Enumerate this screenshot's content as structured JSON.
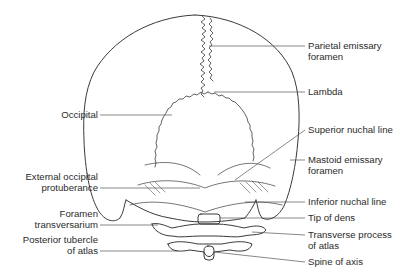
{
  "diagram": {
    "labels_right": [
      {
        "id": "parietal-emissary-foramen",
        "text": "Parietal emissary",
        "text2": "foramen"
      },
      {
        "id": "lambda",
        "text": "Lambda"
      },
      {
        "id": "superior-nuchal-line",
        "text": "Superior nuchal line"
      },
      {
        "id": "mastoid-emissary-foramen",
        "text": "Mastoid emissary",
        "text2": "foramen"
      },
      {
        "id": "inferior-nuchal-line",
        "text": "Inferior nuchal line"
      },
      {
        "id": "tip-of-dens",
        "text": "Tip of dens"
      },
      {
        "id": "transverse-process-of-atlas",
        "text": "Transverse process",
        "text2": "of atlas"
      },
      {
        "id": "spine-of-axis",
        "text": "Spine of axis"
      }
    ],
    "labels_left": [
      {
        "id": "occipital",
        "text": "Occipital"
      },
      {
        "id": "external-occipital-protuberance",
        "text": "External occipital",
        "text2": "protuberance"
      },
      {
        "id": "foramen-transversarium",
        "text": "Foramen",
        "text2": "transversarium"
      },
      {
        "id": "posterior-tubercle-of-atlas",
        "text": "Posterior tubercle",
        "text2": "of atlas"
      }
    ],
    "colors": {
      "line": "#3a3a3a",
      "leader": "#555555",
      "text": "#2b2b2b",
      "background": "#ffffff"
    }
  }
}
